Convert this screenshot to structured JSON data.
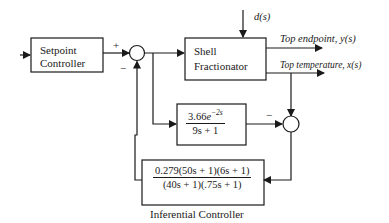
{
  "diagram": {
    "type": "control block diagram",
    "blocks": {
      "setpoint_controller": {
        "line1": "Setpoint",
        "line2": "Controller"
      },
      "shell_fractionator": {
        "line1": "Shell",
        "line2": "Fractionator"
      },
      "delay_model": {
        "num_coef": "3.66",
        "num_exp_base": "e",
        "num_exp": "−2s",
        "den": "9s + 1"
      },
      "inferential_controller": {
        "num": "0.279(50s + 1)(6s + 1)",
        "den": "(40s + 1)(.75s + 1)",
        "caption": "Inferential Controller"
      }
    },
    "signals": {
      "disturbance": "d(s)",
      "top_endpoint": "Top endpoint, y(s)",
      "top_temperature": "Top temperature, x(s)"
    },
    "summing_junctions": {
      "sj1": {
        "plus": "+",
        "minus": "−"
      },
      "sj2": {
        "minus": "−"
      }
    },
    "colors": {
      "line": "#1a1a1a",
      "background": "#ffffff"
    }
  }
}
